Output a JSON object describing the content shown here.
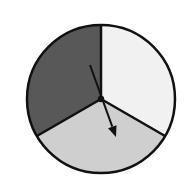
{
  "spinner": {
    "sections": [
      {
        "name": "light",
        "color": "#f1f1f1",
        "start_deg": 0,
        "end_deg": 120
      },
      {
        "name": "medium",
        "color": "#cfcfcf",
        "start_deg": 120,
        "end_deg": 240
      },
      {
        "name": "dark",
        "color": "#585858",
        "start_deg": 240,
        "end_deg": 360
      }
    ],
    "outline_color": "#111111",
    "arrow": {
      "from": [
        90,
        65
      ],
      "to": [
        116,
        137
      ],
      "color": "#111111"
    },
    "center": [
      101,
      99
    ],
    "radius": 74
  }
}
